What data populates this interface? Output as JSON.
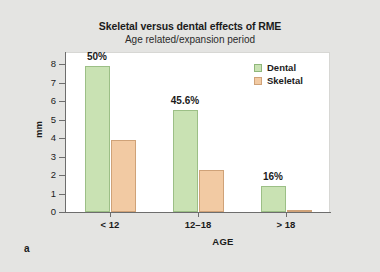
{
  "figure": {
    "letter": "a"
  },
  "legend": {
    "position": "top-right",
    "items": [
      {
        "label": "Dental",
        "color": "#c9e2b3"
      },
      {
        "label": "Skeletal",
        "color": "#f2caa3"
      }
    ]
  },
  "chart_data": {
    "type": "bar",
    "title": "Skeletal versus dental effects of RME",
    "subtitle": "Age related/expansion period",
    "xlabel": "AGE",
    "ylabel": "mm",
    "categories": [
      "< 12",
      "12–18",
      "> 18"
    ],
    "series": [
      {
        "name": "Dental",
        "color": "#c9e2b3",
        "values": [
          7.9,
          5.5,
          1.4
        ]
      },
      {
        "name": "Skeletal",
        "color": "#f2caa3",
        "values": [
          3.9,
          2.25,
          0.1
        ]
      }
    ],
    "annotations": [
      "50%",
      "45.6%",
      "16%"
    ],
    "ylim": [
      0,
      8
    ],
    "yticks": [
      0,
      1,
      2,
      3,
      4,
      5,
      6,
      7,
      8
    ],
    "ytick_labels": [
      "0",
      "1",
      "2",
      "3",
      "4",
      "5",
      "6",
      "7",
      "8"
    ],
    "grid": false
  }
}
